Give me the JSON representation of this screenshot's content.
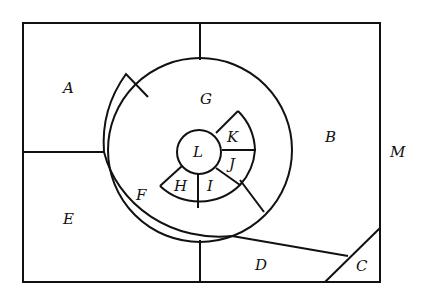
{
  "diagram": {
    "type": "region-map",
    "stroke_color": "#111111",
    "background": "#ffffff",
    "labels": {
      "A": "A",
      "B": "B",
      "C": "C",
      "D": "D",
      "E": "E",
      "F": "F",
      "G": "G",
      "H": "H",
      "I": "I",
      "J": "J",
      "K": "K",
      "L": "L",
      "M": "M"
    }
  }
}
